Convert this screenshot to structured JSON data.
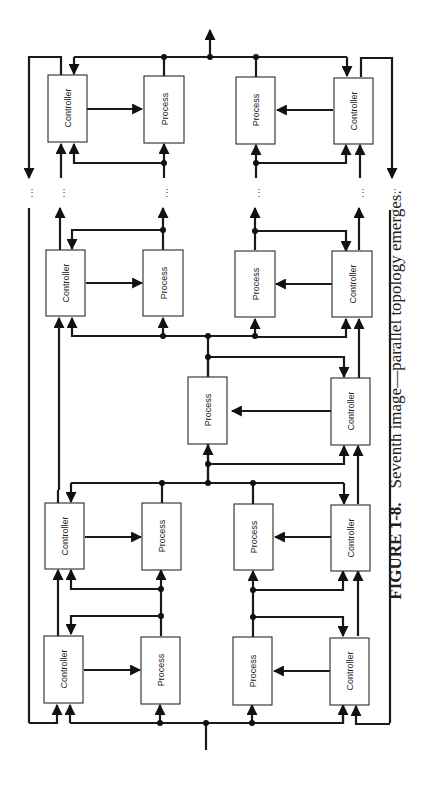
{
  "figure": {
    "number": "FIGURE 1-8.",
    "caption": "Seventh image—parallel topology emerges."
  },
  "labels": {
    "controller": "Controller",
    "process": "Process"
  },
  "blocks": [
    {
      "id": "r1-ctrl-left",
      "type": "controller"
    },
    {
      "id": "r1-proc-left",
      "type": "process"
    },
    {
      "id": "r1-proc-right",
      "type": "process"
    },
    {
      "id": "r1-ctrl-right",
      "type": "controller"
    },
    {
      "id": "r2-ctrl-left",
      "type": "controller"
    },
    {
      "id": "r2-proc-left",
      "type": "process"
    },
    {
      "id": "r2-proc-right",
      "type": "process"
    },
    {
      "id": "r2-ctrl-right",
      "type": "controller"
    },
    {
      "id": "center-proc",
      "type": "process"
    },
    {
      "id": "center-ctrl",
      "type": "controller"
    },
    {
      "id": "r3-ctrl-left",
      "type": "controller"
    },
    {
      "id": "r3-proc-left",
      "type": "process"
    },
    {
      "id": "r3-proc-right",
      "type": "process"
    },
    {
      "id": "r3-ctrl-right",
      "type": "controller"
    },
    {
      "id": "r4-ctrl-left",
      "type": "controller"
    },
    {
      "id": "r4-proc-left",
      "type": "process"
    },
    {
      "id": "r4-proc-right",
      "type": "process"
    },
    {
      "id": "r4-ctrl-right",
      "type": "controller"
    }
  ],
  "continuation": "⋮",
  "colors": {
    "ink": "#1a1a1a",
    "paper": "#ffffff"
  }
}
